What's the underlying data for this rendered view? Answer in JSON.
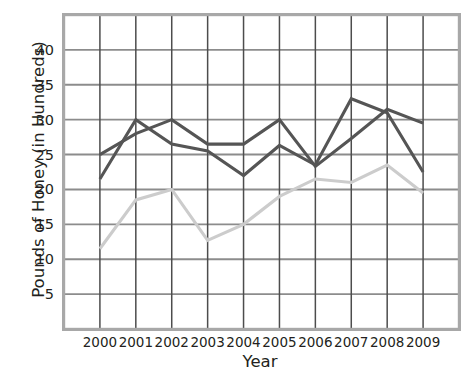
{
  "chart_data": {
    "type": "line",
    "title": "",
    "xlabel": "Year",
    "ylabel": "Pounds of Honey (in Hundreds)",
    "categories": [
      "2000",
      "2001",
      "2002",
      "2003",
      "2004",
      "2005",
      "2006",
      "2007",
      "2008",
      "2009"
    ],
    "x": [
      2000,
      2001,
      2002,
      2003,
      2004,
      2005,
      2006,
      2007,
      2008,
      2009
    ],
    "xlim": [
      2000,
      2009
    ],
    "ylim": [
      0,
      45
    ],
    "yticks": [
      5,
      10,
      15,
      20,
      25,
      30,
      35,
      40
    ],
    "ytick_labels": [
      "5",
      "10",
      "15",
      "20",
      "25",
      "30",
      "35",
      "40"
    ],
    "grid": true,
    "legend": "none",
    "series": [
      {
        "name": "dark-series-1",
        "color": "#555555",
        "values": [
          25.0,
          28.0,
          30.0,
          26.5,
          26.5,
          30.0,
          23.3,
          27.3,
          31.5,
          29.5
        ]
      },
      {
        "name": "dark-series-2",
        "color": "#555555",
        "values": [
          21.5,
          30.0,
          26.5,
          25.5,
          22.0,
          26.3,
          23.5,
          33.0,
          31.0,
          22.5
        ]
      },
      {
        "name": "light-series",
        "color": "#cccccc",
        "values": [
          11.5,
          18.5,
          20.0,
          12.7,
          15.0,
          19.0,
          21.5,
          21.0,
          23.5,
          19.5
        ]
      }
    ]
  },
  "axes": {
    "ylabel": "Pounds of Honey (in Hundreds)",
    "xlabel": "Year"
  },
  "colors": {
    "frame": "#a8a8a8",
    "grid": "#4d4d4d",
    "grid_major": "#8c8c8c",
    "dark_line": "#555555",
    "light_line": "#cccccc",
    "text": "#231f20",
    "background": "#ffffff"
  }
}
